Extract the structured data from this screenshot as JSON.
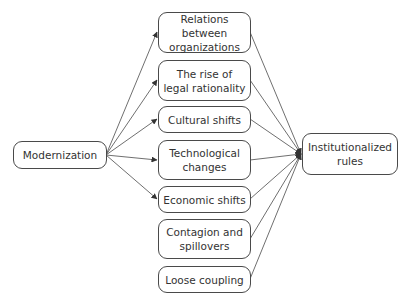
{
  "diagram": {
    "type": "flow",
    "source": {
      "id": "modernization",
      "label": "Modernization"
    },
    "mediators": [
      {
        "id": "relations",
        "label": "Relations between organizations"
      },
      {
        "id": "legal",
        "label": "The rise of legal rationality"
      },
      {
        "id": "cultural",
        "label": "Cultural shifts"
      },
      {
        "id": "technological",
        "label": "Technological changes"
      },
      {
        "id": "economic",
        "label": "Economic shifts"
      },
      {
        "id": "contagion",
        "label": "Contagion and spillovers"
      },
      {
        "id": "coupling",
        "label": "Loose coupling"
      }
    ],
    "target": {
      "id": "institutionalized",
      "label": "Institutionalized rules"
    },
    "edges": [
      {
        "from": "modernization",
        "to": "relations"
      },
      {
        "from": "modernization",
        "to": "legal"
      },
      {
        "from": "modernization",
        "to": "cultural"
      },
      {
        "from": "modernization",
        "to": "technological"
      },
      {
        "from": "modernization",
        "to": "economic"
      },
      {
        "from": "relations",
        "to": "institutionalized"
      },
      {
        "from": "legal",
        "to": "institutionalized"
      },
      {
        "from": "cultural",
        "to": "institutionalized"
      },
      {
        "from": "technological",
        "to": "institutionalized"
      },
      {
        "from": "economic",
        "to": "institutionalized"
      },
      {
        "from": "contagion",
        "to": "institutionalized"
      },
      {
        "from": "coupling",
        "to": "institutionalized"
      }
    ],
    "colors": {
      "stroke": "#4a4a4a",
      "text": "#333333",
      "background": "#ffffff"
    }
  }
}
